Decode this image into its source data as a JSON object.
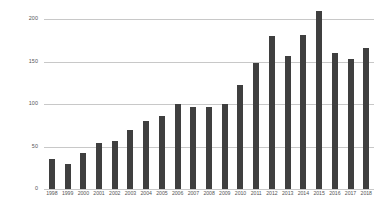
{
  "chart_data": {
    "type": "bar",
    "title": "",
    "subtitle": "",
    "xlabel": "",
    "ylabel": "",
    "categories": [
      "1998",
      "1999",
      "2000",
      "2001",
      "2002",
      "2003",
      "2004",
      "2005",
      "2006",
      "2007",
      "2008",
      "2009",
      "2010",
      "2011",
      "2012",
      "2013",
      "2014",
      "2015",
      "2016",
      "2017",
      "2018"
    ],
    "values": [
      35,
      29,
      42,
      54,
      57,
      69,
      80,
      86,
      100,
      97,
      96,
      100,
      122,
      148,
      180,
      157,
      181,
      209,
      160,
      153,
      166
    ],
    "series": [
      {
        "name": "",
        "values": [
          35,
          29,
          42,
          54,
          57,
          69,
          80,
          86,
          100,
          97,
          96,
          100,
          122,
          148,
          180,
          157,
          181,
          209,
          160,
          153,
          166
        ]
      }
    ],
    "ylim": [
      0,
      208
    ],
    "yticks": [
      0,
      50,
      100,
      150,
      200
    ],
    "ytick_labels": [
      "0",
      "50",
      "100",
      "150",
      "200"
    ],
    "grid": true,
    "grid_axis": "y",
    "legend": false,
    "legend_position": "none",
    "bar_color": "#3f3f3f",
    "gridline_color": "#c8c8c8",
    "background_color": "#ffffff",
    "tick_label_color": "#555555",
    "annotations": []
  }
}
